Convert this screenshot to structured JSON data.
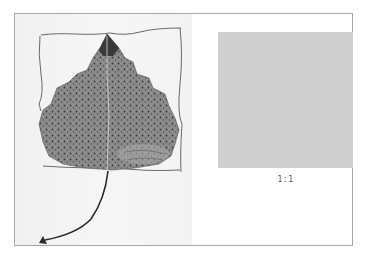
{
  "figure": {
    "photo": {
      "subject": "dried-leaf-with-hand-drawn-square-frame",
      "background_color": "#f3f3f3",
      "leaf_color": "#7a7a7a",
      "frame_stroke_color": "#6a6a6a"
    },
    "swatch": {
      "color": "#cfcfcf",
      "label": "1:1"
    },
    "border_color": "#a8a8a8"
  }
}
